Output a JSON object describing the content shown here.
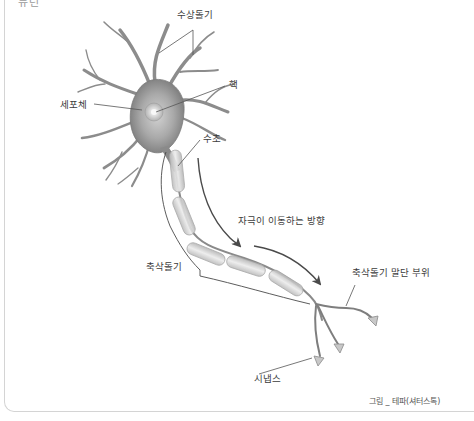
{
  "header": {
    "cut_off_text": "뉴런"
  },
  "diagram": {
    "labels": {
      "dendrites": "수상돌기",
      "nucleus": "핵",
      "cell_body": "세포체",
      "myelin_sheath": "수초",
      "signal_direction": "자극이 이동하는 방향",
      "axon": "축삭돌기",
      "axon_terminal": "축삭돌기 말단 부위",
      "synapse": "시냅스"
    },
    "caption": "그림 _ 테파(셔터스톡)"
  },
  "colors": {
    "frame_border": "#d4d4d4",
    "label_text": "#3c3c3c",
    "leader_line": "#555555",
    "neuron_dark": "#6e6e6e",
    "neuron_mid": "#a8a8a8",
    "neuron_light": "#d8d8d8",
    "arrow": "#4a4a4a"
  }
}
